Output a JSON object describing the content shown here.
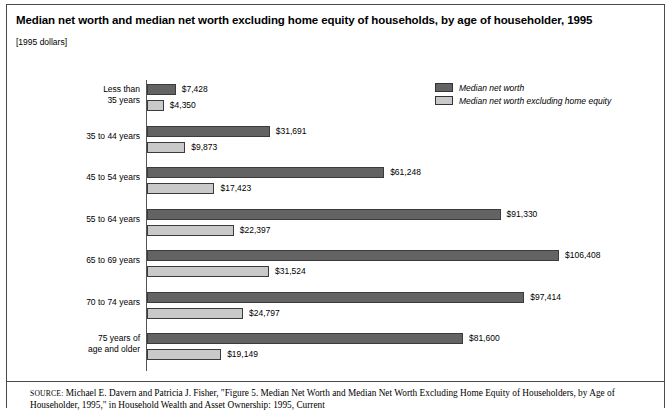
{
  "figure": {
    "title": "Median net worth and median net worth excluding home equity of households, by age of householder, 1995",
    "units": "[1995 dollars]",
    "source_label": "SOURCE:",
    "source_text": " Michael E. Davern and Patricia J. Fisher, \"Figure 5. Median Net Worth and Median Net Worth Excluding Home Equity of Householders, by Age of Householder, 1995,\" in Household Wealth and Asset Ownership: 1995, Current"
  },
  "legend": {
    "items": [
      {
        "label": "Median net worth",
        "color": "#636363",
        "swatch": "dark"
      },
      {
        "label": "Median net worth excluding home equity",
        "color": "#c9c9c9",
        "swatch": "light"
      }
    ]
  },
  "chart_data": {
    "type": "bar",
    "orientation": "horizontal",
    "title": "Median net worth and median net worth excluding home equity of households, by age of householder, 1995",
    "subtitle": "[1995 dollars]",
    "xlabel": "",
    "ylabel": "",
    "units": "1995 dollars",
    "grid": false,
    "legend_position": "top-right",
    "xlim": [
      0,
      106408
    ],
    "categories": [
      "Less than 35 years",
      "35 to 44 years",
      "45 to 54 years",
      "55 to 64 years",
      "65 to 69 years",
      "70 to 74 years",
      "75 years of age and older"
    ],
    "category_lines": [
      [
        "Less than",
        "35 years"
      ],
      [
        "35 to 44 years"
      ],
      [
        "45 to 54 years"
      ],
      [
        "55 to 64 years"
      ],
      [
        "65 to 69 years"
      ],
      [
        "70 to 74 years"
      ],
      [
        "75 years of",
        "age and older"
      ]
    ],
    "series": [
      {
        "name": "Median net worth",
        "color": "#636363",
        "values": [
          7428,
          31691,
          61248,
          91330,
          106408,
          97414,
          81600
        ],
        "labels": [
          "$7,428",
          "$31,691",
          "$61,248",
          "$91,330",
          "$106,408",
          "$97,414",
          "$81,600"
        ]
      },
      {
        "name": "Median net worth excluding home equity",
        "color": "#c9c9c9",
        "values": [
          4350,
          9873,
          17423,
          22397,
          31524,
          24797,
          19149
        ],
        "labels": [
          "$4,350",
          "$9,873",
          "$17,423",
          "$22,397",
          "$31,524",
          "$24,797",
          "$19,149"
        ]
      }
    ]
  }
}
